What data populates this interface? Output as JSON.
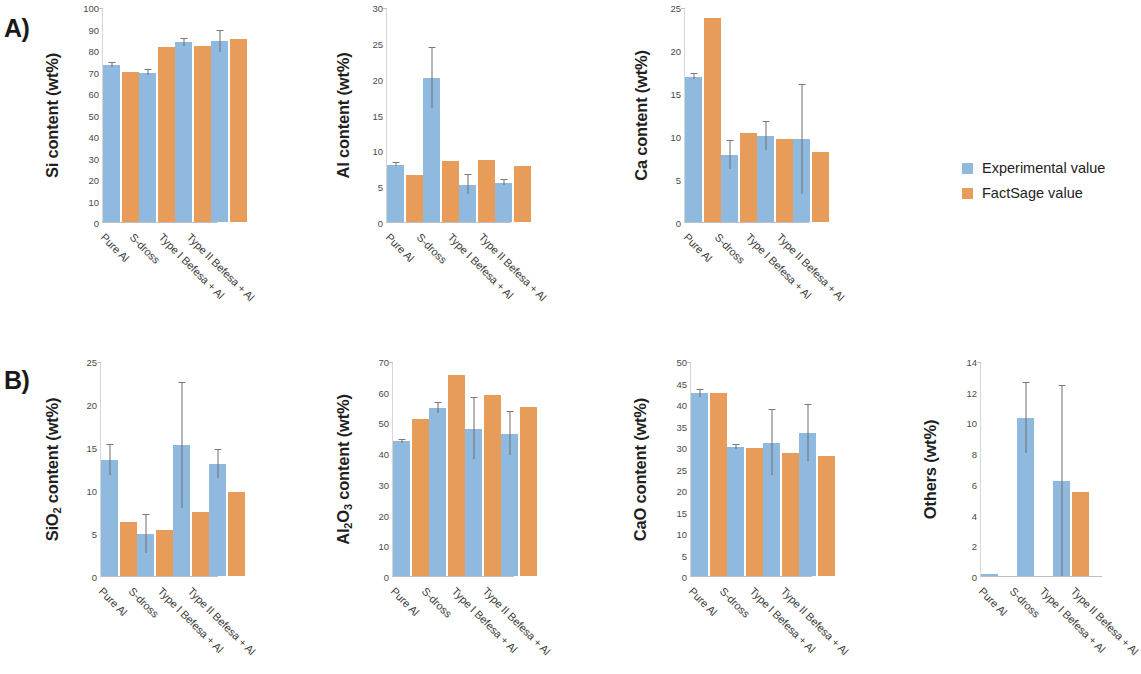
{
  "figure": {
    "panel_a_label": "A)",
    "panel_b_label": "B)"
  },
  "legend": {
    "position": "right-middle",
    "items": [
      {
        "label": "Experimental value",
        "color": "#8fb9de"
      },
      {
        "label": "FactSage value",
        "color": "#e79d59"
      }
    ]
  },
  "categories": [
    "Pure Al",
    "S-dross",
    "Type I Befesa + Al",
    "Type II Befesa + Al"
  ],
  "series_names": [
    "Experimental value",
    "FactSage value"
  ],
  "colors": {
    "experimental": "#8fb9de",
    "factsage": "#e79d59"
  },
  "chart_data": [
    {
      "id": "si",
      "panel": "A)",
      "type": "bar",
      "title": "",
      "xlabel": "",
      "ylabel": "Si content (wt%)",
      "ylim": [
        0,
        100
      ],
      "yticks": [
        0,
        10,
        20,
        30,
        40,
        50,
        60,
        70,
        80,
        90,
        100
      ],
      "grid": false,
      "categories": [
        "Pure Al",
        "S-dross",
        "Type I Befesa + Al",
        "Type II Befesa + Al"
      ],
      "series": [
        {
          "name": "Experimental value",
          "values": [
            73.0,
            69.5,
            83.5,
            84.0
          ],
          "errors": [
            1.0,
            1.2,
            1.5,
            5.0
          ]
        },
        {
          "name": "FactSage value",
          "values": [
            70.0,
            81.5,
            82.0,
            85.0
          ],
          "errors": [
            0,
            0,
            0,
            0
          ]
        }
      ]
    },
    {
      "id": "al",
      "panel": "A)",
      "type": "bar",
      "title": "",
      "xlabel": "",
      "ylabel": "Al content (wt%)",
      "ylim": [
        0,
        30
      ],
      "yticks": [
        0,
        5,
        10,
        15,
        20,
        25,
        30
      ],
      "grid": false,
      "categories": [
        "Pure Al",
        "S-dross",
        "Type I Befesa + Al",
        "Type II Befesa + Al"
      ],
      "series": [
        {
          "name": "Experimental value",
          "values": [
            8.0,
            20.1,
            5.2,
            5.5
          ],
          "errors": [
            0.2,
            4.2,
            1.3,
            0.4
          ]
        },
        {
          "name": "FactSage value",
          "values": [
            6.5,
            8.5,
            8.7,
            7.8
          ],
          "errors": [
            0,
            0,
            0,
            0
          ]
        }
      ]
    },
    {
      "id": "ca",
      "panel": "A)",
      "type": "bar",
      "title": "",
      "xlabel": "",
      "ylabel": "Ca content (wt%)",
      "ylim": [
        0,
        25
      ],
      "yticks": [
        0,
        5,
        10,
        15,
        20,
        25
      ],
      "grid": false,
      "categories": [
        "Pure Al",
        "S-dross",
        "Type I Befesa + Al",
        "Type II Befesa + Al"
      ],
      "series": [
        {
          "name": "Experimental value",
          "values": [
            16.9,
            7.8,
            10.0,
            9.6
          ],
          "errors": [
            0.3,
            1.6,
            1.6,
            6.3
          ]
        },
        {
          "name": "FactSage value",
          "values": [
            23.7,
            10.4,
            9.6,
            8.1
          ],
          "errors": [
            0,
            0,
            0,
            0
          ]
        }
      ]
    },
    {
      "id": "sio2",
      "panel": "B)",
      "type": "bar",
      "title": "",
      "xlabel": "",
      "ylabel": "SiO2 content (wt%)",
      "ylabel_html": "SiO<sub>2</sub> content (wt%)",
      "ylim": [
        0,
        25
      ],
      "yticks": [
        0,
        5,
        10,
        15,
        20,
        25
      ],
      "grid": false,
      "categories": [
        "Pure Al",
        "S-dross",
        "Type I Befesa + Al",
        "Type II Befesa + Al"
      ],
      "series": [
        {
          "name": "Experimental value",
          "values": [
            13.5,
            4.9,
            15.2,
            13.0
          ],
          "errors": [
            1.7,
            2.2,
            7.3,
            1.6
          ]
        },
        {
          "name": "FactSage value",
          "values": [
            6.3,
            5.3,
            7.5,
            9.8
          ],
          "errors": [
            0,
            0,
            0,
            0
          ]
        }
      ]
    },
    {
      "id": "al2o3",
      "panel": "B)",
      "type": "bar",
      "title": "",
      "xlabel": "",
      "ylabel": "Al2O3 content (wt%)",
      "ylabel_html": "Al<sub>2</sub>O<sub>3</sub> content (wt%)",
      "ylim": [
        0,
        70
      ],
      "yticks": [
        0,
        10,
        20,
        30,
        40,
        50,
        60,
        70
      ],
      "grid": false,
      "categories": [
        "Pure Al",
        "S-dross",
        "Type I Befesa + Al",
        "Type II Befesa + Al"
      ],
      "series": [
        {
          "name": "Experimental value",
          "values": [
            43.8,
            54.7,
            48.0,
            46.3
          ],
          "errors": [
            0.5,
            1.6,
            10.0,
            7.0
          ]
        },
        {
          "name": "FactSage value",
          "values": [
            51.0,
            65.3,
            58.8,
            55.0
          ],
          "errors": [
            0,
            0,
            0,
            0
          ]
        }
      ]
    },
    {
      "id": "cao",
      "panel": "B)",
      "type": "bar",
      "title": "",
      "xlabel": "",
      "ylabel": "CaO content (wt%)",
      "ylim": [
        0,
        50
      ],
      "yticks": [
        0,
        5,
        10,
        15,
        20,
        25,
        30,
        35,
        40,
        45,
        50
      ],
      "grid": false,
      "categories": [
        "Pure Al",
        "S-dross",
        "Type I Befesa + Al",
        "Type II Befesa + Al"
      ],
      "series": [
        {
          "name": "Experimental value",
          "values": [
            42.5,
            30.0,
            31.0,
            33.3
          ],
          "errors": [
            0.8,
            0.5,
            7.5,
            6.5
          ]
        },
        {
          "name": "FactSage value",
          "values": [
            42.5,
            29.8,
            28.5,
            27.8
          ],
          "errors": [
            0,
            0,
            0,
            0
          ]
        }
      ]
    },
    {
      "id": "others",
      "panel": "B)",
      "type": "bar",
      "title": "",
      "xlabel": "",
      "ylabel": "Others (wt%)",
      "ylim": [
        0,
        14
      ],
      "yticks": [
        0,
        2,
        4,
        6,
        8,
        10,
        12,
        14
      ],
      "grid": false,
      "categories": [
        "Pure Al",
        "S-dross",
        "Type I Befesa + Al",
        "Type II Befesa + Al"
      ],
      "series": [
        {
          "name": "Experimental value",
          "values": [
            0.15,
            10.3,
            6.2,
            0
          ],
          "errors": [
            0,
            2.3,
            6.2,
            0
          ]
        },
        {
          "name": "FactSage value",
          "values": [
            0,
            0,
            5.5,
            0
          ],
          "errors": [
            0,
            0,
            0,
            0
          ]
        }
      ]
    }
  ]
}
